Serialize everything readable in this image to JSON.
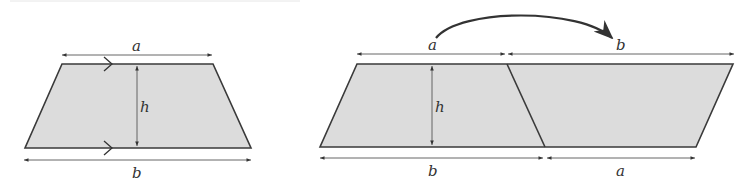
{
  "colors": {
    "fill": "#dcdcdc",
    "outline": "#3a3a3a",
    "dimension": "#555555",
    "label": "#333333"
  },
  "left_figure": {
    "name": "trapezium",
    "top_side_label": "a",
    "bottom_side_label": "b",
    "height_label": "h",
    "parallel_marks": "single-chevron on top and bottom edges"
  },
  "right_figure": {
    "name": "parallelogram from two trapeziums",
    "top_labels": [
      "a",
      "b"
    ],
    "bottom_labels": [
      "b",
      "a"
    ],
    "height_label": "h",
    "curved_arrow": "from a to b (rotated copy)"
  }
}
